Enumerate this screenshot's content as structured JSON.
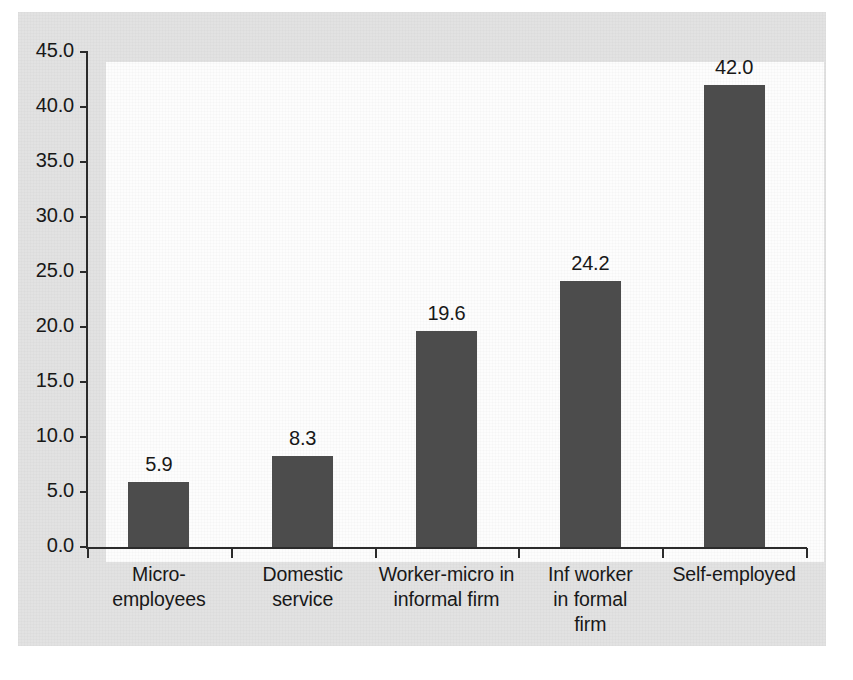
{
  "chart_data": {
    "type": "bar",
    "title": "",
    "subtitle": "",
    "xlabel": "",
    "ylabel": "",
    "categories": [
      "Micro-employees",
      "Domestic service",
      "Worker-micro in informal firm",
      "Inf worker in formal firm",
      "Self-employed"
    ],
    "category_lines": [
      [
        "Micro-employees"
      ],
      [
        "Domestic",
        "service"
      ],
      [
        "Worker-micro in",
        "informal firm"
      ],
      [
        "Inf worker",
        "in formal",
        "firm"
      ],
      [
        "Self-employed"
      ]
    ],
    "values": [
      5.9,
      8.3,
      19.6,
      24.2,
      42.0
    ],
    "value_labels": [
      "5.9",
      "8.3",
      "19.6",
      "24.2",
      "42.0"
    ],
    "ylim": [
      0,
      45
    ],
    "ytick_values": [
      0,
      5,
      10,
      15,
      20,
      25,
      30,
      35,
      40,
      45
    ],
    "ytick_labels": [
      "0.0",
      "5.0",
      "10.0",
      "15.0",
      "20.0",
      "25.0",
      "30.0",
      "35.0",
      "40.0",
      "45.0"
    ],
    "grid": false,
    "legend": false,
    "legend_position": "none",
    "bar_color": "#4c4c4c",
    "plot_background": "#fdfdfd",
    "figure_background": "#e2e2e2",
    "axis_color": "#2b2b2b",
    "text_color": "#181818"
  }
}
